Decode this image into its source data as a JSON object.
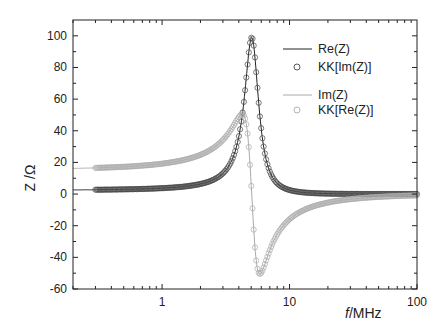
{
  "chart_data": {
    "type": "line",
    "title": "",
    "xlabel": "f / MHz",
    "ylabel": "Z / Ω",
    "xscale": "log",
    "xlim": [
      0.2,
      100
    ],
    "ylim": [
      -60,
      110
    ],
    "xticks": [
      1,
      10,
      100
    ],
    "xtick_labels": [
      "1",
      "10",
      "100"
    ],
    "yticks": [
      -60,
      -40,
      -20,
      0,
      20,
      40,
      60,
      80,
      100
    ],
    "ytick_labels": [
      "-60",
      "-40",
      "-20",
      "0",
      "20",
      "40",
      "60",
      "80",
      "100"
    ],
    "grid": false,
    "legend_position": "upper right",
    "model": {
      "f0": 5.05,
      "peak": 99,
      "half_width": 0.8
    },
    "annotations": {
      "re_peak": {
        "f": 5.05,
        "value": 99
      },
      "im_max": {
        "f": 4.2,
        "value": 49
      },
      "im_min": {
        "f": 5.9,
        "value": -51
      }
    },
    "series": [
      {
        "name": "Re(Z)",
        "style": "line",
        "color": "#222222",
        "key": "re"
      },
      {
        "name": "KK[Im(Z)]",
        "style": "open-circle",
        "color": "#444444",
        "key": "re"
      },
      {
        "name": "Im(Z)",
        "style": "line",
        "color": "#aaaaaa",
        "key": "im"
      },
      {
        "name": "KK[Re(Z)]",
        "style": "open-circle",
        "color": "#aaaaaa",
        "key": "im"
      }
    ]
  },
  "legend": {
    "items": [
      {
        "label": "Re(Z)"
      },
      {
        "label": "KK[Im(Z)]"
      },
      {
        "label": "Im(Z)"
      },
      {
        "label": "KK[Re(Z)]"
      }
    ]
  },
  "axes": {
    "xlabel_f": "f",
    "xlabel_unit": "/MHz",
    "ylabel": "Z /Ω"
  }
}
